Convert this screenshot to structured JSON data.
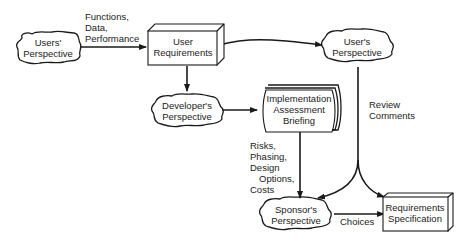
{
  "nodes": {
    "users_perspective": {
      "lines": [
        "Users'",
        "Perspective"
      ],
      "shape": "cloud"
    },
    "user_requirements": {
      "lines": [
        "User",
        "Requirements"
      ],
      "shape": "3d-box"
    },
    "user_perspective": {
      "lines": [
        "User's",
        "Perspective"
      ],
      "shape": "cloud"
    },
    "developer_perspective": {
      "lines": [
        "Developer's",
        "Perspective"
      ],
      "shape": "cloud"
    },
    "implementation_briefing": {
      "lines": [
        "Implementation",
        "Assessment",
        "Briefing"
      ],
      "shape": "document-stack"
    },
    "sponsor_perspective": {
      "lines": [
        "Sponsor's",
        "Perspective"
      ],
      "shape": "cloud"
    },
    "requirements_specification": {
      "lines": [
        "Requirements",
        "Specification"
      ],
      "shape": "3d-box"
    }
  },
  "edge_labels": {
    "functions": [
      "Functions,",
      "Data,",
      "Performance"
    ],
    "review": [
      "Review",
      "Comments"
    ],
    "risks": [
      "Risks,",
      "Phasing,",
      "Design",
      "Options,",
      "Costs"
    ],
    "choices": [
      "Choices"
    ]
  },
  "edges": [
    {
      "from": "users_perspective",
      "to": "user_requirements",
      "label": "functions"
    },
    {
      "from": "user_requirements",
      "to": "user_perspective"
    },
    {
      "from": "user_requirements",
      "to": "developer_perspective"
    },
    {
      "from": "developer_perspective",
      "to": "implementation_briefing"
    },
    {
      "from": "user_perspective",
      "to": "sponsor_perspective",
      "label": "review"
    },
    {
      "from": "user_perspective",
      "to": "requirements_specification",
      "label": "review"
    },
    {
      "from": "implementation_briefing",
      "to": "sponsor_perspective",
      "label": "risks"
    },
    {
      "from": "sponsor_perspective",
      "to": "requirements_specification",
      "label": "choices"
    }
  ]
}
